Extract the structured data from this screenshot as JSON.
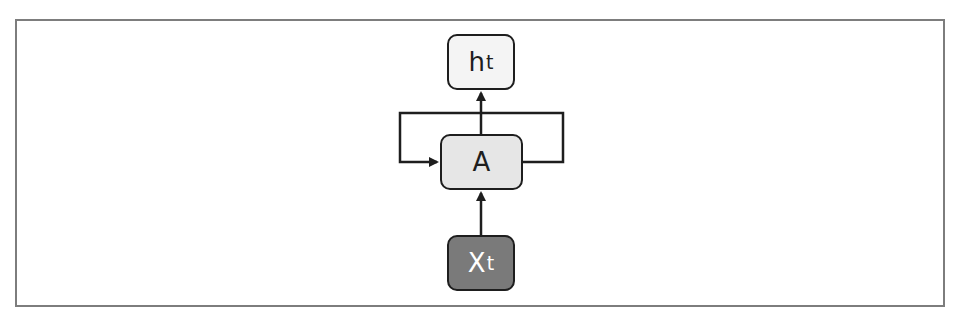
{
  "diagram": {
    "type": "recurrent-neural-network-cell",
    "nodes": {
      "output": {
        "main": "h",
        "sub": "t",
        "fill": "#f4f4f4"
      },
      "cell": {
        "main": "A",
        "sub": "",
        "fill": "#e6e6e6"
      },
      "input": {
        "main": "X",
        "sub": "t",
        "fill": "#7a7a7a"
      }
    },
    "edges": [
      {
        "from": "input",
        "to": "cell"
      },
      {
        "from": "cell",
        "to": "output"
      },
      {
        "from": "cell",
        "to": "cell",
        "kind": "recurrent-loop"
      }
    ],
    "colors": {
      "stroke": "#1e1e1e",
      "frame": "#7d7d7d"
    }
  }
}
